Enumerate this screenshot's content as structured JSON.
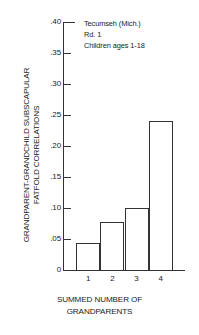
{
  "chart_data": {
    "type": "bar",
    "title": "",
    "categories": [
      "1",
      "2",
      "3",
      "4"
    ],
    "values": [
      0.043,
      0.078,
      0.1,
      0.24
    ],
    "xlabel": "SUMMED NUMBER OF GRANDPARENTS",
    "ylabel": "GRANDPARENT-GRANDCHILD SUBSCAPULAR FATFOLD CORRELATIONS",
    "ylim": [
      0,
      0.4
    ],
    "ytick_values": [
      0.4,
      0.35,
      0.3,
      0.25,
      0.2,
      0.15,
      0.1,
      0.05,
      0
    ],
    "ytick_labels": [
      ".40",
      ".35",
      ".30",
      ".25",
      ".20",
      ".15",
      ".10",
      ".05",
      "0"
    ],
    "grid": false,
    "legend": "none",
    "annotations": [
      "Tecumseh (Mich.)",
      "Rd. 1",
      "Children ages 1-18"
    ],
    "bar_edge_color": "#333333",
    "bar_fill_color": "#ffffff"
  },
  "axes": {
    "ylabel_line1": "GRANDPARENT-GRANDCHILD SUBSCAPULAR",
    "ylabel_line2": "FATFOLD CORRELATIONS",
    "xlabel_line1": "SUMMED NUMBER OF",
    "xlabel_line2": "GRANDPARENTS"
  },
  "annotation": {
    "line1": "Tecumseh (Mich.)",
    "line2": "Rd. 1",
    "line3": "Children ages 1-18"
  }
}
